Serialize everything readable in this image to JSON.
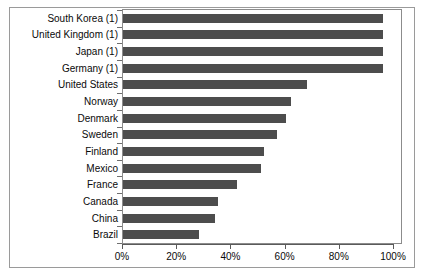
{
  "chart_data": {
    "type": "bar",
    "orientation": "horizontal",
    "title": "",
    "xlabel": "",
    "ylabel": "",
    "xlim": [
      0,
      100
    ],
    "xticks": [
      "0%",
      "20%",
      "40%",
      "60%",
      "80%",
      "100%"
    ],
    "xtick_values": [
      0,
      20,
      40,
      60,
      80,
      100
    ],
    "grid": false,
    "legend": false,
    "bar_color": "#4d4d4d",
    "categories": [
      "South Korea (1)",
      "United Kingdom (1)",
      "Japan (1)",
      "Germany (1)",
      "United States",
      "Norway",
      "Denmark",
      "Sweden",
      "Finland",
      "Mexico",
      "France",
      "Canada",
      "China",
      "Brazil"
    ],
    "values": [
      96,
      96,
      96,
      96,
      68,
      62,
      60,
      57,
      52,
      51,
      42,
      35,
      34,
      28
    ]
  }
}
